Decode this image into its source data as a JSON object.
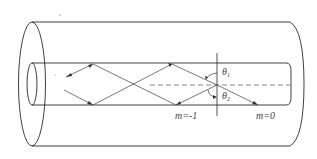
{
  "diagram": {
    "type": "optical-fiber-ray-diagram",
    "labels": {
      "theta1": "θ",
      "theta1_sub": "1",
      "theta2": "θ",
      "theta2_sub": "2",
      "mode_minus1": "m=-1",
      "mode_zero": "m=0"
    },
    "colors": {
      "stroke": "#2a2a2a",
      "ray": "#555555",
      "background": "#ffffff"
    }
  }
}
